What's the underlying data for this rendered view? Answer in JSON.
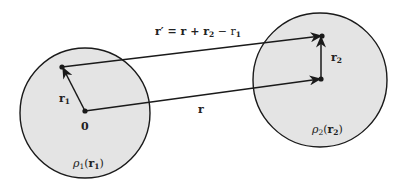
{
  "colors": {
    "background": "#ffffff",
    "region_fill": "#e4e4e4",
    "stroke": "#1a1a1a",
    "text": "#222222"
  },
  "regions": [
    {
      "id": "rho1",
      "label_main": "ρ",
      "label_sub": "1",
      "label_arg_open": "(",
      "label_arg": "r",
      "label_arg_sub": "1",
      "label_arg_close": ")"
    },
    {
      "id": "rho2",
      "label_main": "ρ",
      "label_sub": "2",
      "label_arg_open": "(",
      "label_arg": "r",
      "label_arg_sub": "2",
      "label_arg_close": ")"
    }
  ],
  "vectors": {
    "r1": {
      "label": "r",
      "sub": "1"
    },
    "r2": {
      "label": "r",
      "sub": "2"
    },
    "r": {
      "label": "r"
    },
    "r_prime": {
      "label": "r′ = r + r",
      "sub_a": "2",
      "mid": " − r",
      "sub_b": "1"
    }
  },
  "origin_label": "0"
}
